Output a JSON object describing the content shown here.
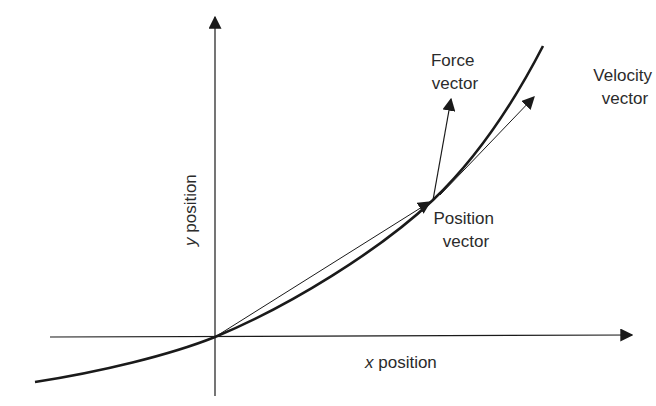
{
  "diagram": {
    "type": "vector-kinematics",
    "colors": {
      "stroke": "#1a1a1a",
      "text": "#2b2b2b",
      "background": "#ffffff"
    },
    "axes": {
      "x": {
        "label_italic": "x",
        "label_rest": " position"
      },
      "y": {
        "label_italic": "y",
        "label_rest": " position"
      }
    },
    "vectors": {
      "force": {
        "line1": "Force",
        "line2": "vector"
      },
      "velocity": {
        "line1": "Velocity",
        "line2": "vector"
      },
      "position": {
        "line1": "Position",
        "line2": "vector"
      }
    }
  }
}
